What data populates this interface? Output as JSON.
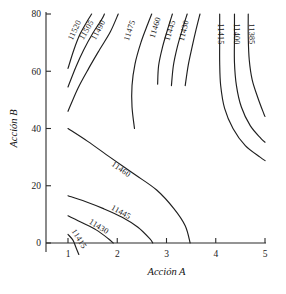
{
  "chart_data": {
    "type": "contour",
    "title": "",
    "xlabel": "Acción A",
    "ylabel": "Acción B",
    "xlim": [
      0.6,
      5.2
    ],
    "ylim": [
      -12,
      82
    ],
    "xticks": [
      "1",
      "2",
      "3",
      "4",
      "5"
    ],
    "xtick_values": [
      1,
      2,
      3,
      4,
      5
    ],
    "yticks": [
      "0",
      "20",
      "40",
      "60",
      "80"
    ],
    "ytick_values": [
      0,
      20,
      40,
      60,
      80
    ],
    "grid": false,
    "legend": "none",
    "levels": [
      11385,
      11400,
      11415,
      11430,
      11445,
      11460,
      11475,
      11490,
      11505,
      11520
    ],
    "contours": [
      {
        "level": "11520",
        "label": "11520",
        "label_pos": {
          "x": 1.18,
          "y": 74
        },
        "points": [
          [
            1.0,
            61.0
          ],
          [
            1.12,
            67.5
          ],
          [
            1.24,
            72.8
          ],
          [
            1.38,
            77.2
          ],
          [
            1.48,
            80.0
          ]
        ]
      },
      {
        "level": "11505",
        "label": "11505",
        "label_pos": {
          "x": 1.42,
          "y": 74
        },
        "points": [
          [
            1.0,
            54.5
          ],
          [
            1.16,
            61.5
          ],
          [
            1.32,
            67.5
          ],
          [
            1.5,
            73.2
          ],
          [
            1.68,
            78.0
          ],
          [
            1.74,
            80.0
          ]
        ]
      },
      {
        "level": "11490",
        "label": "11490",
        "label_pos": {
          "x": 1.66,
          "y": 74
        },
        "points": [
          [
            1.0,
            46.0
          ],
          [
            1.2,
            54.0
          ],
          [
            1.42,
            61.0
          ],
          [
            1.64,
            67.5
          ],
          [
            1.86,
            73.8
          ],
          [
            2.02,
            80.0
          ]
        ]
      },
      {
        "level": "11475",
        "label": "11475",
        "label_pos": {
          "x": 2.3,
          "y": 74
        },
        "points": [
          [
            2.35,
            40.0
          ],
          [
            2.3,
            47.5
          ],
          [
            2.3,
            55.0
          ],
          [
            2.36,
            62.5
          ],
          [
            2.48,
            70.0
          ],
          [
            2.62,
            76.5
          ],
          [
            2.7,
            80.0
          ]
        ]
      },
      {
        "level": "11460",
        "label": "11460",
        "label_pos": {
          "x": 2.82,
          "y": 75
        },
        "points": [
          [
            2.82,
            55.5
          ],
          [
            2.84,
            62.0
          ],
          [
            2.92,
            68.5
          ],
          [
            3.02,
            74.5
          ],
          [
            3.12,
            80.0
          ]
        ]
      },
      {
        "level": "11460b",
        "label": "11460",
        "label_pos": {
          "x": 2.05,
          "y": 25
        },
        "points": [
          [
            1.0,
            40.0
          ],
          [
            1.4,
            35.5
          ],
          [
            1.85,
            30.0
          ],
          [
            2.35,
            24.0
          ],
          [
            2.8,
            18.5
          ],
          [
            3.15,
            12.0
          ],
          [
            3.38,
            6.0
          ],
          [
            3.48,
            0.0
          ]
        ]
      },
      {
        "level": "11445",
        "label": "11445",
        "label_pos": {
          "x": 3.12,
          "y": 74
        },
        "points": [
          [
            3.1,
            55.0
          ],
          [
            3.14,
            62.0
          ],
          [
            3.22,
            68.5
          ],
          [
            3.32,
            74.5
          ],
          [
            3.42,
            80.0
          ]
        ]
      },
      {
        "level": "11445b",
        "label": "11445",
        "label_pos": {
          "x": 2.05,
          "y": 10
        },
        "points": [
          [
            1.0,
            16.5
          ],
          [
            1.35,
            14.5
          ],
          [
            1.72,
            12.0
          ],
          [
            2.1,
            9.0
          ],
          [
            2.42,
            5.5
          ],
          [
            2.66,
            1.5
          ],
          [
            2.72,
            0.0
          ]
        ]
      },
      {
        "level": "11430",
        "label": "11430",
        "label_pos": {
          "x": 3.4,
          "y": 74
        },
        "points": [
          [
            3.38,
            55.0
          ],
          [
            3.44,
            62.0
          ],
          [
            3.52,
            68.5
          ],
          [
            3.6,
            74.5
          ],
          [
            3.68,
            80.0
          ]
        ]
      },
      {
        "level": "11430b",
        "label": "11430",
        "label_pos": {
          "x": 1.6,
          "y": 5
        },
        "points": [
          [
            1.0,
            9.5
          ],
          [
            1.3,
            7.0
          ],
          [
            1.58,
            4.5
          ],
          [
            1.82,
            1.5
          ],
          [
            1.92,
            0.0
          ]
        ]
      },
      {
        "level": "11415",
        "label": "11415",
        "label_pos": {
          "x": 4.05,
          "y": 73
        },
        "points": [
          [
            4.08,
            80.0
          ],
          [
            4.08,
            72.0
          ],
          [
            4.08,
            63.0
          ],
          [
            4.1,
            55.0
          ],
          [
            4.18,
            47.0
          ],
          [
            4.35,
            40.0
          ],
          [
            4.6,
            34.0
          ],
          [
            4.9,
            30.0
          ],
          [
            5.0,
            28.8
          ]
        ]
      },
      {
        "level": "11415b",
        "label": "11415",
        "label_pos": {
          "x": 1.18,
          "y": 1
        },
        "points": [
          [
            1.0,
            3.0
          ],
          [
            1.1,
            1.0
          ],
          [
            1.16,
            -1.5
          ],
          [
            1.22,
            -4.0
          ]
        ]
      },
      {
        "level": "11400",
        "label": "11400",
        "label_pos": {
          "x": 4.38,
          "y": 73
        },
        "points": [
          [
            4.38,
            80.0
          ],
          [
            4.38,
            72.0
          ],
          [
            4.38,
            63.0
          ],
          [
            4.42,
            55.0
          ],
          [
            4.52,
            47.5
          ],
          [
            4.7,
            41.0
          ],
          [
            4.92,
            36.5
          ],
          [
            5.0,
            35.2
          ]
        ]
      },
      {
        "level": "11385",
        "label": "11385",
        "label_pos": {
          "x": 4.68,
          "y": 73
        },
        "points": [
          [
            4.66,
            80.0
          ],
          [
            4.66,
            72.0
          ],
          [
            4.68,
            64.0
          ],
          [
            4.74,
            57.0
          ],
          [
            4.86,
            50.5
          ],
          [
            4.98,
            45.0
          ],
          [
            5.0,
            44.2
          ]
        ]
      }
    ]
  },
  "figure": {
    "axis_color": "#2b2b2b",
    "contour_color": "#1f1f1f",
    "background": "#ffffff"
  }
}
